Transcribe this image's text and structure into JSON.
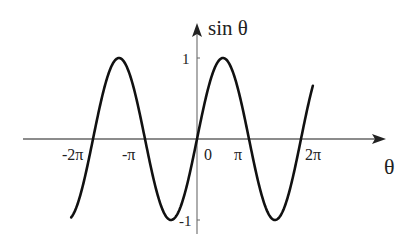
{
  "chart_data": {
    "type": "line",
    "title": "",
    "function": "sin θ",
    "xlabel": "θ",
    "ylabel": "sin θ",
    "x_tick_labels": [
      "-2π",
      "-π",
      "0",
      "π",
      "2π"
    ],
    "x_ticks": [
      -6.2832,
      -3.1416,
      0,
      3.1416,
      6.2832
    ],
    "y_tick_labels": [
      "1",
      "-1"
    ],
    "y_ticks": [
      1,
      -1
    ],
    "xlim": [
      -7.8,
      7.6
    ],
    "ylim": [
      -1,
      1
    ],
    "series": [
      {
        "name": "sin θ",
        "x_range": [
          -7.6,
          7.0
        ],
        "samples": [
          {
            "x": -7.6,
            "y": -0.96
          },
          {
            "x": -6.2832,
            "y": 0
          },
          {
            "x": -4.7124,
            "y": 1
          },
          {
            "x": -3.1416,
            "y": 0
          },
          {
            "x": -1.5708,
            "y": -1
          },
          {
            "x": 0,
            "y": 0
          },
          {
            "x": 1.5708,
            "y": 1
          },
          {
            "x": 3.1416,
            "y": 0
          },
          {
            "x": 4.7124,
            "y": -1
          },
          {
            "x": 6.2832,
            "y": 0
          },
          {
            "x": 7.854,
            "y": 1
          },
          {
            "x": 9.4248,
            "y": 0
          }
        ]
      }
    ],
    "grid": false,
    "legend": null
  },
  "labels": {
    "y_axis": "sin θ",
    "x_axis": "θ",
    "y_one": "1",
    "y_neg_one": "-1",
    "x_neg2pi": "-2π",
    "x_negpi": "-π",
    "x_zero": "0",
    "x_pi": "π",
    "x_2pi": "2π"
  }
}
